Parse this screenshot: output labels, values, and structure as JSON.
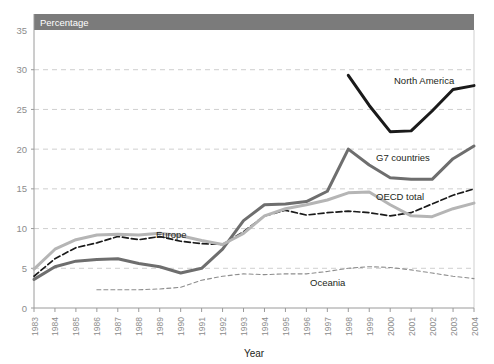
{
  "banner": {
    "label": "Percentage"
  },
  "axis": {
    "x_title": "Year"
  },
  "labels": {
    "north_america": "North America",
    "g7": "G7 countries",
    "oecd": "OECD total",
    "europe": "Europe",
    "oceania": "Oceania"
  },
  "colors": {
    "banner_bg": "#7b7b7b",
    "north_america": "#1a1a1a",
    "g7": "#6e6e6e",
    "oecd": "#1a1a1a",
    "europe": "#b5b5b5",
    "oceania": "#8d8d8d",
    "gridline": "#cfcfcf",
    "axis": "#9a9a9a",
    "tick_text": "#8d8d8d"
  },
  "chart_data": {
    "type": "line",
    "title": "",
    "xlabel": "Year",
    "ylabel": "Percentage",
    "ylim": [
      0,
      35
    ],
    "yticks": [
      0,
      5,
      10,
      15,
      20,
      25,
      30,
      35
    ],
    "grid": true,
    "legend": "inline-annotations",
    "x": [
      1983,
      1984,
      1985,
      1986,
      1987,
      1988,
      1989,
      1990,
      1991,
      1992,
      1993,
      1994,
      1995,
      1996,
      1997,
      1998,
      1999,
      2000,
      2001,
      2002,
      2003,
      2004
    ],
    "xticks": [
      "1983",
      "1984",
      "1985",
      "1986",
      "1987",
      "1988",
      "1989",
      "1990",
      "1991",
      "1992",
      "1993",
      "1994",
      "1995",
      "1996",
      "1997",
      "1998",
      "1999",
      "2000",
      "2001",
      "2002",
      "2003",
      "2004"
    ],
    "series": [
      {
        "name": "North America",
        "style": "solid",
        "width": "thick",
        "color": "#1a1a1a",
        "x": [
          1998,
          1999,
          2000,
          2001,
          2002,
          2003,
          2004
        ],
        "values": [
          29.3,
          25.5,
          22.2,
          22.3,
          24.8,
          27.5,
          28.0
        ]
      },
      {
        "name": "G7 countries",
        "style": "solid",
        "width": "thick",
        "color": "#6e6e6e",
        "x": [
          1983,
          1984,
          1985,
          1986,
          1987,
          1988,
          1989,
          1990,
          1991,
          1992,
          1993,
          1994,
          1995,
          1996,
          1997,
          1998,
          1999,
          2000,
          2001,
          2002,
          2003,
          2004
        ],
        "values": [
          3.6,
          5.2,
          5.9,
          6.1,
          6.2,
          5.6,
          5.2,
          4.4,
          5.0,
          7.4,
          11.0,
          13.0,
          13.1,
          13.4,
          14.7,
          20.0,
          18.0,
          16.4,
          16.2,
          16.2,
          18.8,
          20.4
        ]
      },
      {
        "name": "OECD total",
        "style": "dashed",
        "width": "medium",
        "color": "#1a1a1a",
        "x": [
          1983,
          1984,
          1985,
          1986,
          1987,
          1988,
          1989,
          1990,
          1991,
          1992,
          1993,
          1994,
          1995,
          1996,
          1997,
          1998,
          1999,
          2000,
          2001,
          2002,
          2003,
          2004
        ],
        "values": [
          4.0,
          6.2,
          7.6,
          8.2,
          9.0,
          8.6,
          9.0,
          8.4,
          8.1,
          8.0,
          9.6,
          11.6,
          12.3,
          11.7,
          12.0,
          12.2,
          12.0,
          11.6,
          12.0,
          13.1,
          14.2,
          15.0
        ]
      },
      {
        "name": "Europe",
        "style": "solid",
        "width": "thick",
        "color": "#b5b5b5",
        "x": [
          1983,
          1984,
          1985,
          1986,
          1987,
          1988,
          1989,
          1990,
          1991,
          1992,
          1993,
          1994,
          1995,
          1996,
          1997,
          1998,
          1999,
          2000,
          2001,
          2002,
          2003,
          2004
        ],
        "values": [
          4.9,
          7.4,
          8.6,
          9.2,
          9.3,
          9.2,
          9.4,
          9.1,
          8.5,
          8.0,
          9.4,
          11.6,
          12.5,
          13.0,
          13.6,
          14.5,
          14.6,
          13.0,
          11.6,
          11.5,
          12.5,
          13.2
        ]
      },
      {
        "name": "Oceania",
        "style": "dotted-dash",
        "width": "thin",
        "color": "#8d8d8d",
        "x": [
          1986,
          1987,
          1988,
          1989,
          1990,
          1991,
          1992,
          1993,
          1994,
          1995,
          1996,
          1997,
          1998,
          1999,
          2000,
          2001,
          2002,
          2003,
          2004
        ],
        "values": [
          2.3,
          2.3,
          2.3,
          2.4,
          2.6,
          3.5,
          4.0,
          4.3,
          4.2,
          4.3,
          4.3,
          4.6,
          5.0,
          5.2,
          5.1,
          4.8,
          4.4,
          4.0,
          3.7
        ]
      }
    ]
  }
}
